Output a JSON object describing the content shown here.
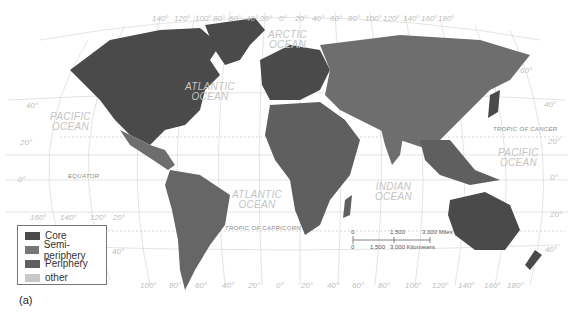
{
  "map": {
    "caption": "(a)",
    "colors": {
      "core": "#4d4d4d",
      "semi_periphery": "#6e6e6e",
      "periphery": "#5e5e5e",
      "other": "#c8c8c8",
      "ocean_label": "#c4c4c4",
      "graticule": "#cfcfcf"
    },
    "legend": [
      {
        "label": "Core",
        "color": "#4a4a4a"
      },
      {
        "label": "Semi-periphery",
        "color": "#777777"
      },
      {
        "label": "Periphery",
        "color": "#5f5f5f"
      },
      {
        "label": "other",
        "color": "#c8c8c8"
      }
    ],
    "oceans": {
      "arctic": [
        "ARCTIC",
        "OCEAN"
      ],
      "atlantic_north": [
        "ATLANTIC",
        "OCEAN"
      ],
      "atlantic_south": [
        "ATLANTIC",
        "OCEAN"
      ],
      "pacific_west": [
        "PACIFIC",
        "OCEAN"
      ],
      "pacific_east": [
        "PACIFIC",
        "OCEAN"
      ],
      "indian": [
        "INDIAN",
        "OCEAN"
      ]
    },
    "lines": {
      "tropic_cancer": "TROPIC OF CANCER",
      "equator": "EQUATOR",
      "tropic_capricorn": "TROPIC OF CAPRICORN"
    },
    "top_longitudes": [
      "140°",
      "120°",
      "100°",
      "80°",
      "60°",
      "40°",
      "20°",
      "0°",
      "20°",
      "40°",
      "60°",
      "80°",
      "100°",
      "120°",
      "140°",
      "160°",
      "180°"
    ],
    "bottom_longitudes": [
      "160°",
      "140°",
      "120°",
      "100°",
      "80°",
      "60°",
      "40°",
      "20°",
      "0°",
      "20°",
      "40°",
      "60°",
      "80°",
      "100°",
      "120°",
      "140°",
      "160°",
      "180°"
    ],
    "left_latitudes": [
      "40°",
      "20°",
      "0°",
      "20°",
      "40°"
    ],
    "right_latitudes": [
      "60°",
      "40°",
      "20°",
      "0°",
      "20°",
      "40°"
    ],
    "scale_bar": {
      "miles": [
        "0",
        "1,500",
        "3,000 Miles"
      ],
      "km": [
        "0",
        "1,500",
        "3,000 Kilometers"
      ]
    }
  }
}
